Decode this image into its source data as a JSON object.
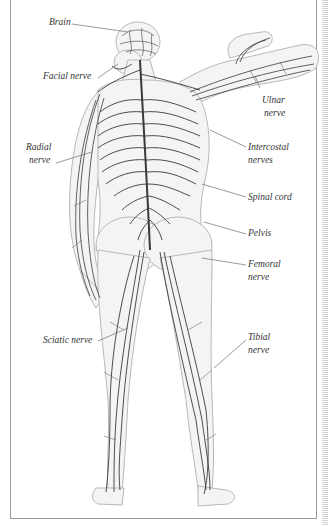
{
  "diagram": {
    "colors": {
      "nerve": "#3a3a3a",
      "body_outline": "#b8b8b8",
      "body_fill": "#f4f4f4",
      "frame": "#9a9a9a",
      "label_text": "#333333",
      "leader_line": "#6e6e6e"
    },
    "labels": [
      {
        "id": "brain",
        "line1": "Brain",
        "line2": ""
      },
      {
        "id": "facial-nerve",
        "line1": "Facial nerve",
        "line2": ""
      },
      {
        "id": "ulnar-nerve",
        "line1": "Ulnar",
        "line2": "nerve"
      },
      {
        "id": "radial-nerve",
        "line1": "Radial",
        "line2": "nerve"
      },
      {
        "id": "intercostal-nerves",
        "line1": "Intercostal",
        "line2": "nerves"
      },
      {
        "id": "spinal-cord",
        "line1": "Spinal cord",
        "line2": ""
      },
      {
        "id": "pelvis",
        "line1": "Pelvis",
        "line2": ""
      },
      {
        "id": "femoral-nerve",
        "line1": "Femoral",
        "line2": "nerve"
      },
      {
        "id": "sciatic-nerve",
        "line1": "Sciatic nerve",
        "line2": ""
      },
      {
        "id": "tibial-nerve",
        "line1": "Tibial",
        "line2": "nerve"
      }
    ]
  }
}
